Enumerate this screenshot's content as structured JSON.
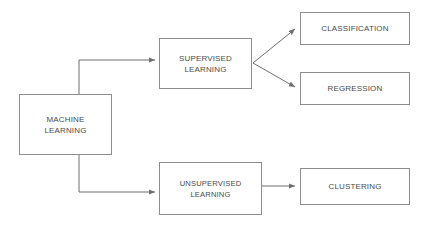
{
  "diagram": {
    "type": "flowchart",
    "canvas": {
      "width": 426,
      "height": 229,
      "background": "#ffffff"
    },
    "style": {
      "box_border_color": "#8d8d8d",
      "box_fill_color": "#ffffff",
      "text_color": "#4a4a4a",
      "connector_color": "#6f6f6f"
    },
    "nodes": [
      {
        "id": "machine-learning",
        "label": "MACHINE\nLEARNING",
        "x": 19,
        "y": 94,
        "width": 93,
        "height": 61
      },
      {
        "id": "supervised-learning",
        "label": "SUPERVISED\nLEARNING",
        "x": 159,
        "y": 38,
        "width": 93,
        "height": 51
      },
      {
        "id": "unsupervised-learning",
        "label": "UNSUPERVISED\nLEARNING",
        "x": 159,
        "y": 162,
        "width": 103,
        "height": 53
      },
      {
        "id": "classification",
        "label": "CLASSIFICATION",
        "x": 300,
        "y": 12,
        "width": 110,
        "height": 33
      },
      {
        "id": "regression",
        "label": "REGRESSION",
        "x": 300,
        "y": 72,
        "width": 110,
        "height": 33
      },
      {
        "id": "clustering",
        "label": "CLUSTERING",
        "x": 300,
        "y": 168,
        "width": 110,
        "height": 37
      }
    ],
    "edges": [
      {
        "id": "ml-to-supervised",
        "from": "machine-learning",
        "to": "supervised-learning",
        "kind": "elbow-up"
      },
      {
        "id": "ml-to-unsupervised",
        "from": "machine-learning",
        "to": "unsupervised-learning",
        "kind": "elbow-down"
      },
      {
        "id": "supervised-to-classification",
        "from": "supervised-learning",
        "to": "classification",
        "kind": "diagonal-up"
      },
      {
        "id": "supervised-to-regression",
        "from": "supervised-learning",
        "to": "regression",
        "kind": "diagonal-down"
      },
      {
        "id": "unsupervised-to-clustering",
        "from": "unsupervised-learning",
        "to": "clustering",
        "kind": "straight"
      }
    ]
  }
}
